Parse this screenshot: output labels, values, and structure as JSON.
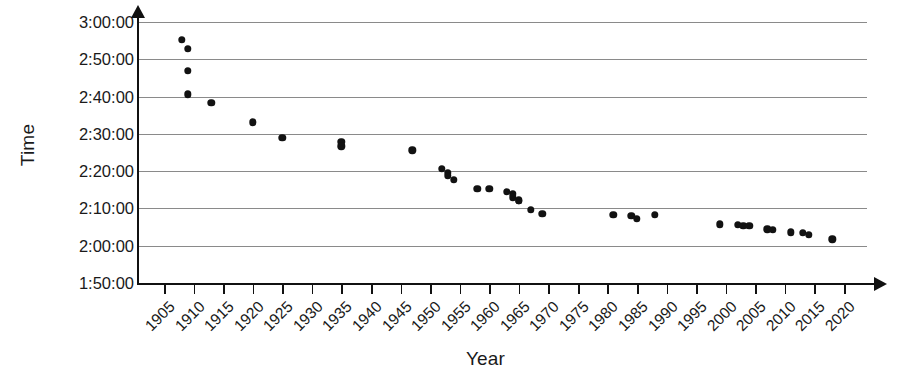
{
  "chart_data": {
    "type": "scatter",
    "title": "",
    "xlabel": "Year",
    "ylabel": "Time",
    "xlim": [
      1903,
      2022
    ],
    "ylim": [
      "1:50:00",
      "3:00:00"
    ],
    "grid": true,
    "legend": false,
    "x_ticks": [
      1905,
      1910,
      1915,
      1920,
      1925,
      1930,
      1935,
      1940,
      1945,
      1950,
      1955,
      1960,
      1965,
      1970,
      1975,
      1980,
      1985,
      1990,
      1995,
      2000,
      2005,
      2010,
      2015,
      2020
    ],
    "y_ticks": [
      "1:50:00",
      "2:00:00",
      "2:10:00",
      "2:20:00",
      "2:30:00",
      "2:40:00",
      "2:50:00",
      "3:00:00"
    ],
    "marker_color": "#121212",
    "gridline_color": "#8a8a8a",
    "axis_color": "#111111",
    "points": [
      {
        "x": 1908,
        "y": "2:55:18",
        "y_minutes": 175.3
      },
      {
        "x": 1909,
        "y": "2:52:45",
        "y_minutes": 172.8
      },
      {
        "x": 1909,
        "y": "2:46:52",
        "y_minutes": 166.9
      },
      {
        "x": 1909,
        "y": "2:40:34",
        "y_minutes": 160.6
      },
      {
        "x": 1913,
        "y": "2:38:16",
        "y_minutes": 158.3
      },
      {
        "x": 1920,
        "y": "2:33:07",
        "y_minutes": 153.1
      },
      {
        "x": 1925,
        "y": "2:29:01",
        "y_minutes": 149.0
      },
      {
        "x": 1935,
        "y": "2:27:49",
        "y_minutes": 147.8
      },
      {
        "x": 1935,
        "y": "2:26:44",
        "y_minutes": 146.7
      },
      {
        "x": 1947,
        "y": "2:25:39",
        "y_minutes": 145.6
      },
      {
        "x": 1952,
        "y": "2:20:42",
        "y_minutes": 140.7
      },
      {
        "x": 1953,
        "y": "2:19:30",
        "y_minutes": 139.5
      },
      {
        "x": 1953,
        "y": "2:18:40",
        "y_minutes": 138.7
      },
      {
        "x": 1954,
        "y": "2:17:39",
        "y_minutes": 137.7
      },
      {
        "x": 1958,
        "y": "2:15:17",
        "y_minutes": 135.3
      },
      {
        "x": 1960,
        "y": "2:15:16",
        "y_minutes": 135.3
      },
      {
        "x": 1963,
        "y": "2:14:28",
        "y_minutes": 134.5
      },
      {
        "x": 1964,
        "y": "2:13:55",
        "y_minutes": 133.9
      },
      {
        "x": 1964,
        "y": "2:13:00",
        "y_minutes": 133.0
      },
      {
        "x": 1965,
        "y": "2:12:12",
        "y_minutes": 132.2
      },
      {
        "x": 1965,
        "y": "2:12:00",
        "y_minutes": 132.0
      },
      {
        "x": 1967,
        "y": "2:09:37",
        "y_minutes": 129.6
      },
      {
        "x": 1969,
        "y": "2:08:34",
        "y_minutes": 128.6
      },
      {
        "x": 1981,
        "y": "2:08:18",
        "y_minutes": 128.3
      },
      {
        "x": 1984,
        "y": "2:08:05",
        "y_minutes": 128.1
      },
      {
        "x": 1985,
        "y": "2:07:12",
        "y_minutes": 127.2
      },
      {
        "x": 1988,
        "y": "2:08:16",
        "y_minutes": 128.3
      },
      {
        "x": 1999,
        "y": "2:05:42",
        "y_minutes": 125.7
      },
      {
        "x": 2002,
        "y": "2:05:38",
        "y_minutes": 125.6
      },
      {
        "x": 2003,
        "y": "2:05:24",
        "y_minutes": 125.4
      },
      {
        "x": 2004,
        "y": "2:05:16",
        "y_minutes": 125.3
      },
      {
        "x": 2007,
        "y": "2:04:26",
        "y_minutes": 124.4
      },
      {
        "x": 2008,
        "y": "2:04:13",
        "y_minutes": 124.2
      },
      {
        "x": 2011,
        "y": "2:03:38",
        "y_minutes": 123.6
      },
      {
        "x": 2013,
        "y": "2:03:23",
        "y_minutes": 123.4
      },
      {
        "x": 2014,
        "y": "2:02:57",
        "y_minutes": 123.0
      },
      {
        "x": 2018,
        "y": "2:01:39",
        "y_minutes": 121.7
      }
    ]
  }
}
